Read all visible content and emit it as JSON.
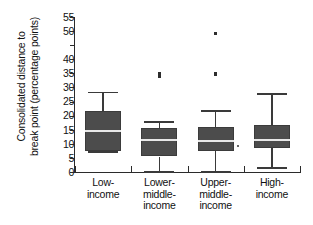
{
  "chart_data": {
    "type": "box",
    "title": "",
    "xlabel": "",
    "ylabel": "Consolidated distance to\nbreak point (percentage points)",
    "ylim": [
      0,
      55
    ],
    "ytick_values": [
      0,
      5,
      10,
      15,
      20,
      25,
      30,
      35,
      40,
      45,
      50,
      55
    ],
    "ytick_labels": [
      "0",
      "5",
      "10",
      "15",
      "20",
      "25",
      "30",
      "35",
      "40",
      "",
      "50",
      "55"
    ],
    "grid": false,
    "legend": "none",
    "categories": [
      "Low-\nincome",
      "Lower-\nmiddle-\nincome",
      "Upper-\nmiddle-\nincome",
      "High-\nincome"
    ],
    "boxes": [
      {
        "category": "Low-income",
        "whisker_low": 7.3,
        "q1": 7.3,
        "median": 14.5,
        "q3": 21.5,
        "whisker_high": 28.5,
        "outliers": []
      },
      {
        "category": "Lower-middle-income",
        "whisker_low": 0.3,
        "q1": 5.5,
        "median": 11.5,
        "q3": 15.5,
        "whisker_high": 18.0,
        "outliers": [
          34.0,
          35.0
        ]
      },
      {
        "category": "Upper-middle-income",
        "whisker_low": 0.3,
        "q1": 7.5,
        "median": 11.0,
        "q3": 16.0,
        "whisker_high": 22.0,
        "outliers": [
          34.8,
          49.2,
          9.2
        ]
      },
      {
        "category": "High-income",
        "whisker_low": 1.7,
        "q1": 8.5,
        "median": 11.3,
        "q3": 16.7,
        "whisker_high": 28.0,
        "outliers": []
      }
    ],
    "colors": {
      "box_fill": "#4c4c4c",
      "median": "#e8e8e8",
      "axis": "#2b2b2b",
      "outlier": "#2d2d2d",
      "background": "#ffffff"
    }
  }
}
